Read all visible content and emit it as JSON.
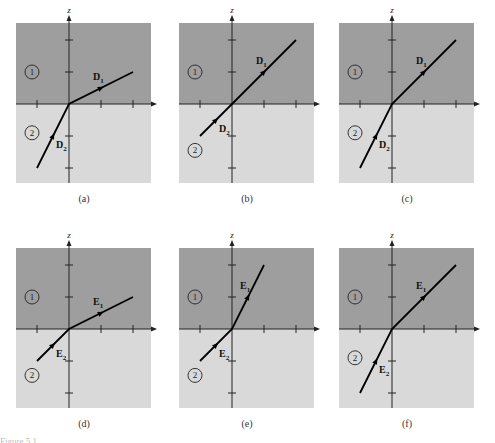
{
  "figure": {
    "axis_labels": {
      "horizontal": "y",
      "vertical": "z"
    },
    "region_labels": [
      "1",
      "2"
    ],
    "colors": {
      "region1": "#9e9e9e",
      "region2": "#d9d9d9",
      "line": "#000000",
      "background": "#ffffff"
    },
    "panels": [
      {
        "id": "a",
        "caption": "(a)",
        "field": "D",
        "upper_label": "D",
        "upper_sub": "1",
        "lower_label": "D",
        "lower_sub": "2",
        "upper_end": [
          2.0,
          1.0
        ],
        "lower_end": [
          -1.0,
          -2.0
        ],
        "region2_label_pos": "mid"
      },
      {
        "id": "b",
        "caption": "(b)",
        "field": "D",
        "upper_label": "D",
        "upper_sub": "1",
        "lower_label": "D",
        "lower_sub": "2",
        "upper_end": [
          2.0,
          2.0
        ],
        "lower_end": [
          -1.0,
          -1.0
        ],
        "region2_label_pos": "low"
      },
      {
        "id": "c",
        "caption": "(c)",
        "field": "D",
        "upper_label": "D",
        "upper_sub": "1",
        "lower_label": "D",
        "lower_sub": "2",
        "upper_end": [
          2.0,
          2.0
        ],
        "lower_end": [
          -1.0,
          -2.0
        ],
        "region2_label_pos": "mid"
      },
      {
        "id": "d",
        "caption": "(d)",
        "field": "E",
        "upper_label": "E",
        "upper_sub": "1",
        "lower_label": "E",
        "lower_sub": "2",
        "upper_end": [
          2.0,
          1.0
        ],
        "lower_end": [
          -1.0,
          -1.0
        ],
        "region2_label_pos": "low"
      },
      {
        "id": "e",
        "caption": "(e)",
        "field": "E",
        "upper_label": "E",
        "upper_sub": "1",
        "lower_label": "E",
        "lower_sub": "2",
        "upper_end": [
          1.0,
          2.0
        ],
        "lower_end": [
          -1.0,
          -1.0
        ],
        "region2_label_pos": "low"
      },
      {
        "id": "f",
        "caption": "(f)",
        "field": "E",
        "upper_label": "E",
        "upper_sub": "1",
        "lower_label": "E",
        "lower_sub": "2",
        "upper_end": [
          2.0,
          2.0
        ],
        "lower_end": [
          -1.0,
          -2.0
        ],
        "region2_label_pos": "mid"
      }
    ],
    "bottom_caption_fragment": "Figure 5.1"
  }
}
